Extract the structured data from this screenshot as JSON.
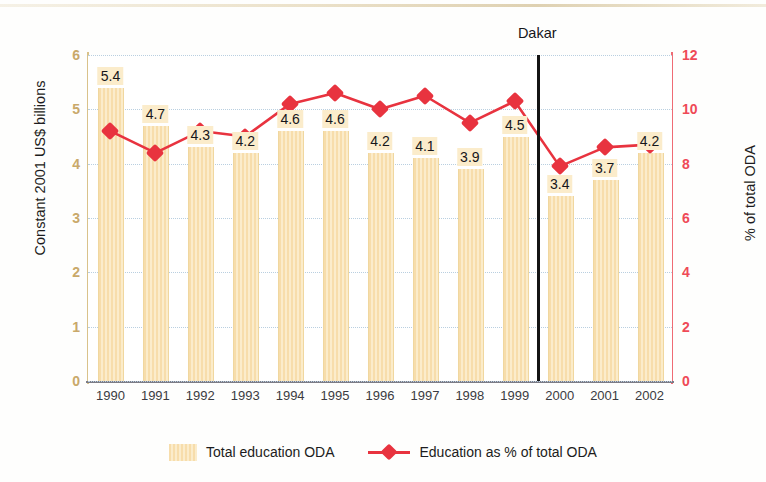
{
  "chart_data": {
    "type": "bar",
    "title": "",
    "categories": [
      "1990",
      "1991",
      "1992",
      "1993",
      "1994",
      "1995",
      "1996",
      "1997",
      "1998",
      "1999",
      "2000",
      "2001",
      "2002"
    ],
    "xlabel": "",
    "ylabel": "Constant 2001 US$ billions",
    "ylabel_right": "% of total ODA",
    "ylim": [
      0,
      6
    ],
    "ylim_right": [
      0,
      12
    ],
    "yticks": [
      "0",
      "1",
      "2",
      "3",
      "4",
      "5",
      "6"
    ],
    "yticks_right": [
      "0",
      "2",
      "4",
      "6",
      "8",
      "10",
      "12"
    ],
    "grid": true,
    "legend_position": "bottom-center",
    "series": [
      {
        "name": "Total education ODA",
        "type": "bar",
        "axis": "left",
        "color": "#f7ddab",
        "values": [
          5.4,
          4.7,
          4.3,
          4.2,
          4.6,
          4.6,
          4.2,
          4.1,
          3.9,
          4.5,
          3.4,
          3.7,
          4.2
        ],
        "labels": [
          "5.4",
          "4.7",
          "4.3",
          "4.2",
          "4.6",
          "4.6",
          "4.2",
          "4.1",
          "3.9",
          "4.5",
          "3.4",
          "3.7",
          "4.2"
        ]
      },
      {
        "name": "Education as % of total ODA",
        "type": "line",
        "axis": "right",
        "color": "#e8333f",
        "values": [
          9.2,
          8.4,
          9.2,
          9.0,
          10.2,
          10.6,
          10.0,
          10.5,
          9.5,
          10.3,
          7.9,
          8.6,
          8.7
        ]
      }
    ],
    "annotations": [
      {
        "name": "dakar-marker",
        "label": "Dakar",
        "x_between": [
          "1999",
          "2000"
        ]
      }
    ]
  },
  "axes": {
    "left_title": "Constant 2001 US$ billions",
    "right_title": "% of total ODA",
    "left_ticks": [
      "6",
      "5",
      "4",
      "3",
      "2",
      "1",
      "0"
    ],
    "right_ticks": [
      "12",
      "10",
      "8",
      "6",
      "4",
      "2",
      "0"
    ]
  },
  "annotation": {
    "dakar_label": "Dakar"
  },
  "legend": {
    "bar_label": "Total education ODA",
    "line_label": "Education as % of total ODA"
  }
}
